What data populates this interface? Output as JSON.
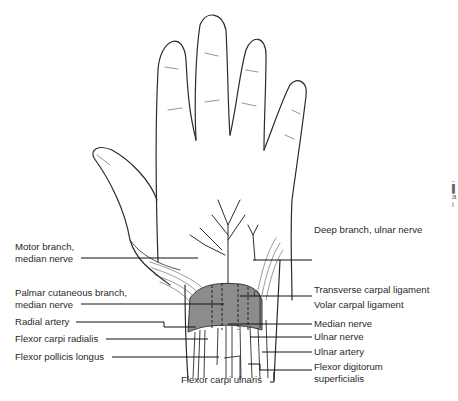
{
  "figure": {
    "colors": {
      "line": "#2b2b2b",
      "ligament_fill": "#8c8c8c",
      "background": "#ffffff"
    }
  },
  "labels": {
    "left": [
      {
        "id": "motor-branch",
        "line1": "Motor branch,",
        "line2": "median nerve"
      },
      {
        "id": "palmar-cutaneous",
        "line1": "Palmar cutaneous branch,",
        "line2": "median nerve"
      },
      {
        "id": "radial-artery",
        "line1": "Radial artery"
      },
      {
        "id": "fcr",
        "line1": "Flexor carpi radialis"
      },
      {
        "id": "fpl",
        "line1": "Flexor pollicis longus"
      }
    ],
    "bottom": [
      {
        "id": "fcu",
        "line1": "Flexor carpi ulnaris"
      }
    ],
    "right": [
      {
        "id": "deep-branch-ulnar",
        "line1": "Deep branch, ulnar nerve"
      },
      {
        "id": "transverse-carpal",
        "line1": "Transverse carpal ligament"
      },
      {
        "id": "volar-carpal",
        "line1": "Volar carpal ligament"
      },
      {
        "id": "median-nerve",
        "line1": "Median nerve"
      },
      {
        "id": "ulnar-nerve",
        "line1": "Ulnar nerve"
      },
      {
        "id": "ulnar-artery",
        "line1": "Ulnar artery"
      },
      {
        "id": "fds",
        "line1": "Flexor digitorum",
        "line2": "superficialis"
      }
    ]
  },
  "edge_fragment": {
    "text": "-\n▌\na\ni"
  }
}
